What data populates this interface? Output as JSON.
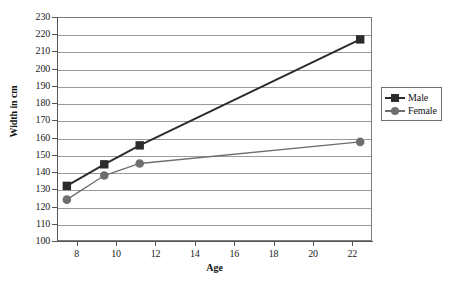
{
  "chart_data": {
    "type": "line",
    "title": "",
    "xlabel": "Age",
    "ylabel": "Width in cm",
    "xlim": [
      7,
      23
    ],
    "ylim": [
      100,
      230
    ],
    "xticks": [
      8,
      10,
      12,
      14,
      16,
      18,
      20,
      22
    ],
    "yticks": [
      100,
      110,
      120,
      130,
      140,
      150,
      160,
      170,
      180,
      190,
      200,
      210,
      220,
      230
    ],
    "grid": true,
    "legend_position": "right",
    "series": [
      {
        "name": "Male",
        "marker": "square",
        "color": "#2b2b2b",
        "x": [
          7.5,
          9.4,
          11.2,
          22.4
        ],
        "values": [
          132,
          144.5,
          155.5,
          217
        ]
      },
      {
        "name": "Female",
        "marker": "circle",
        "color": "#6e6e6e",
        "x": [
          7.5,
          9.4,
          11.2,
          22.4
        ],
        "values": [
          124,
          138,
          145,
          157.5
        ]
      }
    ]
  },
  "axes": {
    "y_title": "Width in cm",
    "x_title": "Age",
    "y_tick_labels": [
      "230",
      "220",
      "210",
      "200",
      "190",
      "180",
      "170",
      "160",
      "150",
      "140",
      "130",
      "120",
      "110",
      "100"
    ],
    "x_tick_labels": [
      "8",
      "10",
      "12",
      "14",
      "16",
      "18",
      "20",
      "22"
    ]
  },
  "legend": {
    "items": [
      {
        "label": "Male",
        "marker": "square-marker",
        "color": "#2b2b2b"
      },
      {
        "label": "Female",
        "marker": "circle-marker",
        "color": "#6e6e6e"
      }
    ]
  }
}
